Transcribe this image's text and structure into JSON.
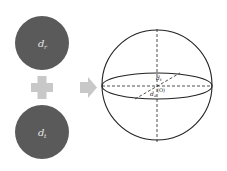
{
  "diagram": {
    "left_circles": [
      {
        "label": "d",
        "subscript": "r",
        "color": "#5a5a5a"
      },
      {
        "label": "d",
        "subscript": "t",
        "color": "#5a5a5a"
      }
    ],
    "operator_symbol": "plus",
    "operator_color": "#c8c8c8",
    "arrow_color": "#c8c8c8",
    "sphere": {
      "labels": {
        "top": "d",
        "top_sub": "t",
        "center": "(O)",
        "bottom": "d",
        "bottom_sub": "a"
      },
      "stroke_color": "#222222"
    }
  }
}
